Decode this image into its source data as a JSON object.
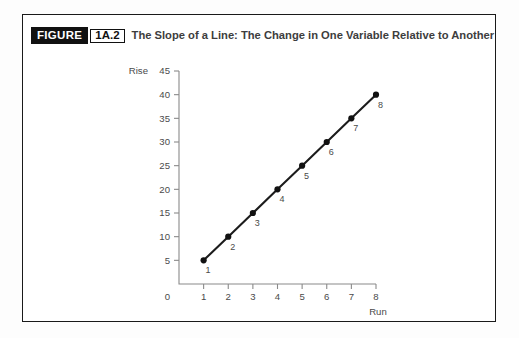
{
  "figure": {
    "tag": "FIGURE",
    "number": "1A.2",
    "title": "The Slope of a Line: The Change in One Variable Relative to Another"
  },
  "colors": {
    "frame": "#1a1a1a",
    "tag_background": "#111111",
    "tag_text": "#ffffff",
    "title_text": "#3d3d3d",
    "axis": "#8a8a8a",
    "line": "#1c1c1c",
    "marker": "#111111",
    "label_text": "#4a4a4a",
    "page_background": "#ffffff"
  },
  "chart_data": {
    "type": "line",
    "title": "The Slope of a Line: The Change in One Variable Relative to Another",
    "xlabel": "Run",
    "ylabel": "Rise",
    "xlim": [
      0,
      8
    ],
    "ylim": [
      0,
      45
    ],
    "grid": false,
    "legend": false,
    "origin_label": "0",
    "x_ticks": [
      1,
      2,
      3,
      4,
      5,
      6,
      7,
      8
    ],
    "x_tick_labels": [
      "1",
      "2",
      "3",
      "4",
      "5",
      "6",
      "7",
      "8"
    ],
    "y_ticks": [
      5,
      10,
      15,
      20,
      25,
      30,
      35,
      40,
      45
    ],
    "y_tick_labels": [
      "5",
      "10",
      "15",
      "20",
      "25",
      "30",
      "35",
      "40",
      "45"
    ],
    "series": [
      {
        "name": "slope",
        "marker": "circle",
        "x": [
          1,
          2,
          3,
          4,
          5,
          6,
          7,
          8
        ],
        "values": [
          5,
          10,
          15,
          20,
          25,
          30,
          35,
          40
        ],
        "point_labels": [
          "1",
          "2",
          "3",
          "4",
          "5",
          "6",
          "7",
          "8"
        ]
      }
    ]
  }
}
